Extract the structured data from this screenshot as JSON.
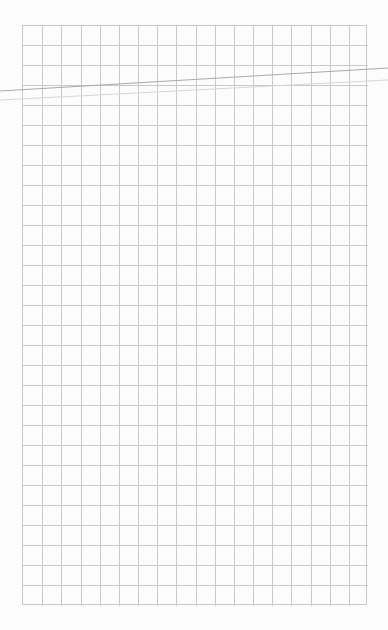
{
  "page": {
    "background": "#fcfcfc"
  },
  "grid": {
    "left": 22,
    "top": 25,
    "columns": 18,
    "rows": 29,
    "cell_width": 19.17,
    "cell_height": 20,
    "line_color": "#c9c9c9"
  },
  "strokes": [
    {
      "x1": 0,
      "y1": 91,
      "x2": 388,
      "y2": 68,
      "color": "#a9a9a9",
      "width": 1
    },
    {
      "x1": 0,
      "y1": 100,
      "x2": 388,
      "y2": 80,
      "color": "#d6d6d6",
      "width": 1
    }
  ]
}
